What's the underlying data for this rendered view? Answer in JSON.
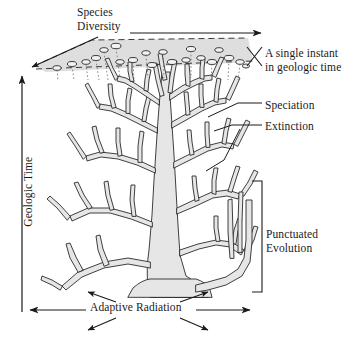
{
  "figure": {
    "type": "evolutionary-tree-diagram",
    "background_color": "#ffffff",
    "ink_color": "#1a1a1a",
    "branch_fill_color": "#e6e6e6",
    "plane_fill_color": "#dcdcdc"
  },
  "labels": {
    "species_diversity": "Species\nDiversity",
    "single_instant": "A single instant\nin geologic time",
    "speciation": "Speciation",
    "extinction": "Extinction",
    "punctuated_evolution": "Punctuated\nEvolution",
    "adaptive_radiation": "Adaptive Radiation",
    "geologic_time": "Geologic Time"
  },
  "axes": [
    {
      "name": "geologic-time-axis",
      "label": "Geologic Time",
      "orientation": "vertical",
      "direction": "upward",
      "arrowheads": 1
    },
    {
      "name": "species-diversity-axis",
      "label": "Species Diversity",
      "orientation": "horizontal",
      "direction": "rightward",
      "arrowheads": 1
    },
    {
      "name": "adaptive-radiation-axis",
      "label": "Adaptive Radiation",
      "orientation": "horizontal",
      "direction": "bidirectional-with-diagonals",
      "arrowheads": 6
    }
  ],
  "annotations": [
    {
      "name": "single-instant-plane",
      "label": "A single instant in geologic time",
      "shape": "shaded-parallelogram",
      "edge_style": "dashed",
      "tip_marker_count": 20
    },
    {
      "name": "speciation-callout",
      "label": "Speciation",
      "points_to": "branch-fork"
    },
    {
      "name": "extinction-callout",
      "label": "Extinction",
      "points_to": "terminated-branch-tip"
    },
    {
      "name": "punctuated-evolution-bracket",
      "label": "Punctuated Evolution",
      "shape": "square-bracket",
      "points_to": "long-stasis-branch-with-rapid-split"
    }
  ]
}
